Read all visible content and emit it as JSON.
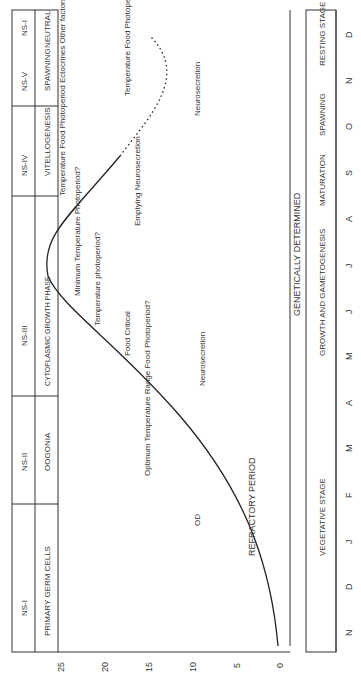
{
  "stages_top": {
    "ns_row": [
      "NS-I",
      "NS-II",
      "NS-III",
      "NS-IV",
      "NS-V",
      "NS-I"
    ],
    "phases": [
      "PRIMARY GERM CELLS",
      "OOGONIA",
      "CYTOPLASMIC GROWTH PHASE",
      "VITELLOGENESIS",
      "SPAWNING",
      "NEUTRAL"
    ]
  },
  "y_axis": {
    "label": "GONAD INDEX",
    "ticks": [
      "0",
      "5",
      "10",
      "15",
      "20",
      "25"
    ]
  },
  "x_axis": {
    "months": [
      "N",
      "D",
      "J",
      "F",
      "M",
      "A",
      "M",
      "J",
      "J",
      "A",
      "S",
      "O",
      "N",
      "D"
    ]
  },
  "bottom_stages": [
    "VEGETATIVE STAGE",
    "GROWTH AND GAMETOGENESIS",
    "MATURATION",
    "SPAWNING",
    "RESTING STAGE"
  ],
  "bands": {
    "refractory": "REFRACTORY PERIOD",
    "genetic": "GENETICALLY DETERMINED"
  },
  "annotations": {
    "optimum": "Optimum Temperature Range Food Photoperiod?",
    "food_critical": "Food Critical",
    "neurosecretion1": "Neurosecretion",
    "temp_photo": "Temperature photoperiod?",
    "min_temp": "Minimum Temperature Photoperiod?",
    "factors": "Temperature Food Photoperiod Ectocrines Other factors",
    "emptying": "Emptying Neurosecretion",
    "late_factors": "Temperature Food Photoperiod?",
    "neurosecretion2": "Neurosecretion",
    "od": "OD"
  }
}
